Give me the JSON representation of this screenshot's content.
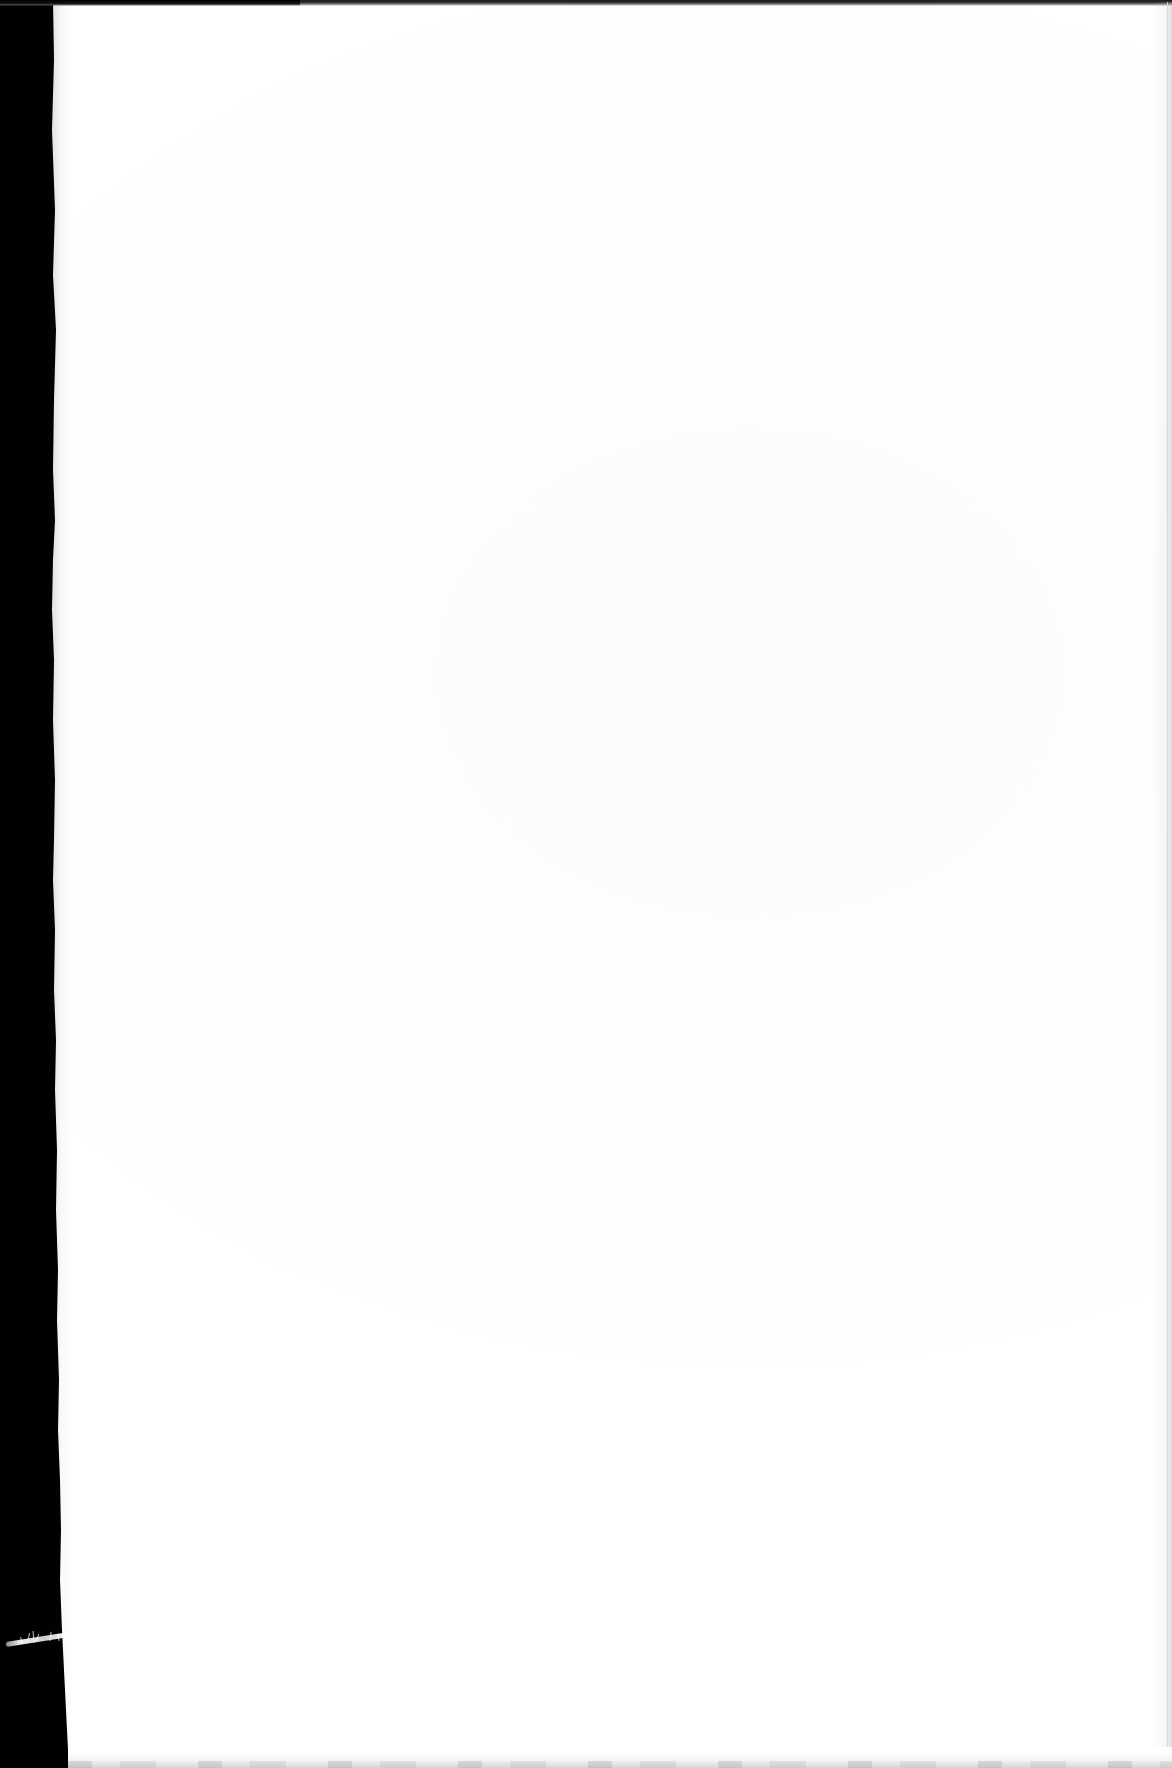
{
  "page": {
    "kind": "scanned-document-page",
    "content_state": "blank",
    "visible_text": "",
    "width": 1172,
    "height": 1768
  },
  "artifacts": {
    "gutter_band": {
      "name": "left-scanner-gutter-band",
      "color": "#010101",
      "width_top": 53,
      "width_bottom": 68,
      "edge": "ragged"
    },
    "top_edge_line": {
      "name": "top-page-edge-line",
      "color": "#1b1b1b",
      "thickness": 6
    },
    "right_edge_line": {
      "name": "right-page-edge-line",
      "color": "#d9dade",
      "thickness": 1
    },
    "bottom_edge_shadow": {
      "name": "bottom-page-edge-shadow",
      "color": "#a0a2aa"
    },
    "fiber": {
      "name": "white-fiber-artifact",
      "color": "#ffffff",
      "position_y": 1645
    },
    "paper": {
      "name": "paper-surface",
      "color": "#fefeff"
    }
  }
}
